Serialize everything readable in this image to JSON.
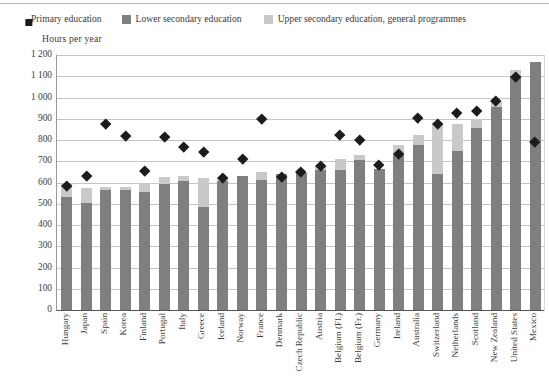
{
  "chart_data": {
    "type": "bar",
    "subtype": "stacked-bar-with-scatter-overlay",
    "title": "",
    "xlabel": "",
    "ylabel": "Hours per year",
    "ylim": [
      0,
      1200
    ],
    "ytick_step": 100,
    "ytick_labels": [
      "1 200",
      "1 100",
      "1 000",
      "900",
      "800",
      "700",
      "600",
      "500",
      "400",
      "300",
      "200",
      "100",
      "0"
    ],
    "grid": true,
    "legend_position": "top",
    "categories": [
      "Hungary",
      "Japan",
      "Spain",
      "Korea",
      "Finland",
      "Portugal",
      "Italy",
      "Greece",
      "Iceland",
      "Norway",
      "France",
      "Denmark",
      "Czech Republic",
      "Austria",
      "Belgium (Fl.)",
      "Belgium (Fr.)",
      "Germany",
      "Ireland",
      "Australia",
      "Switzerland",
      "Netherlands",
      "Scotland",
      "New Zealand",
      "United States",
      "Mexico"
    ],
    "series": [
      {
        "name": "Primary education",
        "type": "scatter",
        "marker": "diamond",
        "color": "#1c1c1c",
        "values": [
          583,
          633,
          878,
          822,
          653,
          815,
          770,
          747,
          623,
          713,
          900,
          627,
          650,
          678,
          825,
          800,
          685,
          735,
          903,
          878,
          930,
          940,
          985,
          1097,
          790
        ]
      },
      {
        "name": "Lower secondary education",
        "type": "bar",
        "color": "#7f7f7f",
        "values": [
          530,
          505,
          565,
          565,
          555,
          595,
          605,
          487,
          605,
          633,
          611,
          640,
          647,
          658,
          660,
          705,
          663,
          735,
          775,
          640,
          750,
          855,
          955,
          1100,
          1167
        ]
      },
      {
        "name": "Upper secondary education, general programmes",
        "type": "bar",
        "color": "#c9c9c9",
        "values": [
          67,
          70,
          13,
          13,
          45,
          30,
          25,
          135,
          15,
          0,
          40,
          0,
          0,
          20,
          50,
          25,
          0,
          40,
          50,
          240,
          125,
          45,
          25,
          30,
          0
        ]
      }
    ],
    "stack_totals": [
      597,
      575,
      578,
      578,
      600,
      625,
      630,
      622,
      620,
      633,
      651,
      640,
      647,
      678,
      710,
      730,
      663,
      775,
      825,
      880,
      875,
      900,
      980,
      1130,
      1167
    ]
  },
  "legend": {
    "items": [
      {
        "label": "Primary education",
        "marker": "diamond",
        "color": "#1c1c1c"
      },
      {
        "label": "Lower secondary education",
        "marker": "square",
        "color": "#7f7f7f"
      },
      {
        "label": "Upper secondary education, general programmes",
        "marker": "square",
        "color": "#c9c9c9"
      }
    ]
  },
  "axis": {
    "y_title": "Hours per year"
  }
}
